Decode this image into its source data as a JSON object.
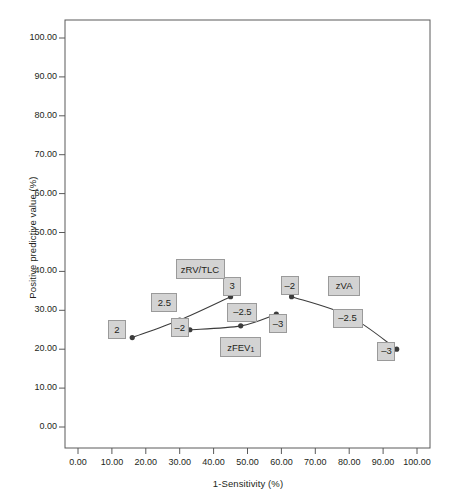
{
  "chart_data": {
    "type": "line",
    "title": "",
    "xlabel": "1-Sensitivity (%)",
    "ylabel": "Positive predictive value (%)",
    "xlim": [
      0,
      100
    ],
    "ylim": [
      0,
      100
    ],
    "xticks": [
      "0.00",
      "10.00",
      "20.00",
      "30.00",
      "40.00",
      "50.00",
      "60.00",
      "70.00",
      "80.00",
      "90.00",
      "100.00"
    ],
    "xtick_values": [
      0,
      10,
      20,
      30,
      40,
      50,
      60,
      70,
      80,
      90,
      100
    ],
    "yticks": [
      "0.00",
      "10.00",
      "20.00",
      "30.00",
      "40.00",
      "50.00",
      "60.00",
      "70.00",
      "80.00",
      "90.00",
      "100.00"
    ],
    "ytick_values": [
      0,
      10,
      20,
      30,
      40,
      50,
      60,
      70,
      80,
      90,
      100
    ],
    "grid": false,
    "legend_position": "inline-annotations",
    "line_color": "#3c3c3c",
    "marker_color": "#3c3c3c",
    "label_fill": "#d3d3d3",
    "label_border": "#9a9a9a",
    "series": [
      {
        "name": "zRV/TLC",
        "name_label_x": 36.0,
        "name_label_y": 40.5,
        "points": [
          {
            "label": "2",
            "x": 16.0,
            "y": 23.0,
            "label_x": 11.5,
            "label_y": 25.0
          },
          {
            "label": "2.5",
            "x": 30.0,
            "y": 27.5,
            "label_x": 25.5,
            "label_y": 32.0
          },
          {
            "label": "3",
            "x": 45.0,
            "y": 33.5,
            "label_x": 45.5,
            "label_y": 36.2
          }
        ]
      },
      {
        "name": "zFEV1",
        "name_display": "zFEV",
        "name_subscript": "1",
        "name_label_x": 48.0,
        "name_label_y": 20.5,
        "points": [
          {
            "label": "–2",
            "x": 33.0,
            "y": 25.0,
            "label_x": 30.0,
            "label_y": 25.5
          },
          {
            "label": "–2.5",
            "x": 48.0,
            "y": 26.0,
            "label_x": 48.5,
            "label_y": 29.5
          },
          {
            "label": "–3",
            "x": 58.5,
            "y": 29.0,
            "label_x": 59.0,
            "label_y": 26.5
          }
        ]
      },
      {
        "name": "zVA",
        "name_label_x": 78.5,
        "name_label_y": 36.2,
        "points": [
          {
            "label": "–2",
            "x": 63.0,
            "y": 33.5,
            "label_x": 62.5,
            "label_y": 36.4
          },
          {
            "label": "–2.5",
            "x": 80.0,
            "y": 28.5,
            "label_x": 79.5,
            "label_y": 28.0
          },
          {
            "label": "–3",
            "x": 94.0,
            "y": 20.0,
            "label_x": 91.0,
            "label_y": 19.5
          }
        ]
      }
    ]
  }
}
